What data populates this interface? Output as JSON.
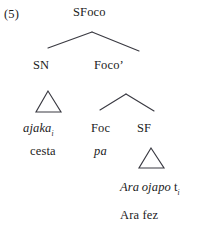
{
  "figure": {
    "example_number": "(5)",
    "type": "syntax-tree",
    "language_note": "Guarani / Portuguese focus phrase structure"
  },
  "nodes": {
    "root": "SFoco",
    "left_daughter": "SN",
    "right_daughter": "Foco’",
    "foc_head": "Foc",
    "sf_node": "SF"
  },
  "terminals": {
    "sn_word": "ajaka",
    "sn_subscript": "i",
    "sn_gloss": "cesta",
    "foc_word": "pa",
    "sf_phrase_part1": "Ara",
    "sf_phrase_part2": "ojapo",
    "sf_trace": "t",
    "sf_trace_subscript": "i",
    "sf_gloss": "Ara fez"
  },
  "triangles": [
    {
      "name": "sn-triangle"
    },
    {
      "name": "sf-triangle"
    }
  ],
  "branches": [
    {
      "name": "root-branch"
    },
    {
      "name": "foco-bar-branch"
    }
  ],
  "colors": {
    "ink": "#1b1b1b",
    "line": "#3a3a42",
    "background": "#ffffff"
  }
}
